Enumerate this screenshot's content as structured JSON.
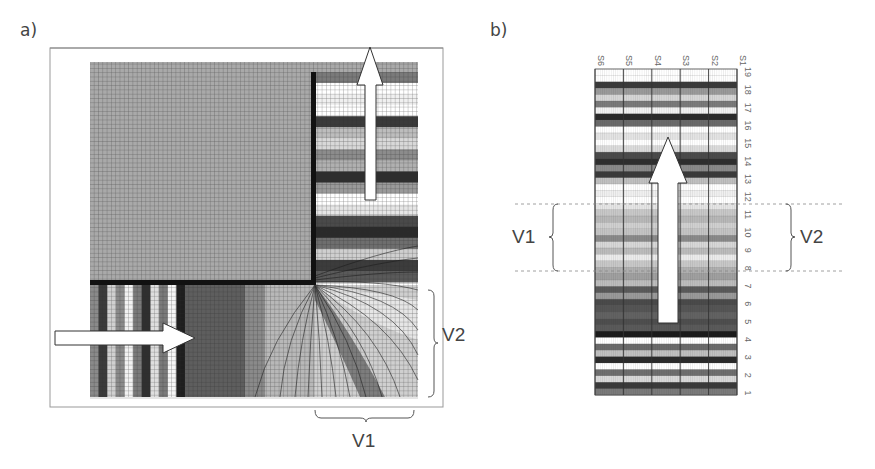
{
  "figure": {
    "panel_a": {
      "label": "a)",
      "brace_right_label": "V2",
      "brace_bottom_label": "V1",
      "arrows": [
        {
          "name": "up-arrow",
          "direction": "up"
        },
        {
          "name": "right-arrow",
          "direction": "right"
        }
      ],
      "upper_right_bands": [
        "#7a7a7a",
        "#ffffff",
        "#f0f0f0",
        "#ffffff",
        "#3a3a3a",
        "#bdbdbd",
        "#d8d8d8",
        "#8c8c8c",
        "#b0b0b0",
        "#2e2e2e",
        "#9a9a9a",
        "#ffffff",
        "#e6e6e6",
        "#4a4a4a",
        "#2a2a2a",
        "#6e6e6e",
        "#cfcfcf",
        "#3c3c3c",
        "#5a5a5a"
      ],
      "lower_left_stripes": [
        "#8a8a8a",
        "#3a3a3a",
        "#d0d0d0",
        "#8a8a8a",
        "#f2f2f2",
        "#7a7a7a",
        "#2f2f2f",
        "#dedede",
        "#7a7a7a",
        "#f5f5f5",
        "#1e1e1e"
      ]
    },
    "panel_b": {
      "label": "b)",
      "columns": [
        "S6",
        "S5",
        "S4",
        "S3",
        "S2",
        "S1"
      ],
      "rows": [
        "1",
        "2",
        "3",
        "4",
        "5",
        "6",
        "7",
        "8",
        "9",
        "10",
        "11",
        "12",
        "13",
        "14",
        "15",
        "16",
        "17",
        "18",
        "19"
      ],
      "brace_left_label": "V1",
      "brace_right_label": "V2",
      "bands": [
        "#ffffff",
        "#ffffff",
        "#3a3a3a",
        "#9a9a9a",
        "#d6d6d6",
        "#7a7a7a",
        "#f2f2f2",
        "#2a2a2a",
        "#6a6a6a",
        "#ffffff",
        "#e4e4e4",
        "#ffffff",
        "#dcdcdc",
        "#4a4a4a",
        "#2e2e2e",
        "#8a8a8a",
        "#3a3a3a",
        "#c0c0c0",
        "#ffffff",
        "#f0f0f0",
        "#ffffff",
        "#e6e6e6",
        "#c8c8c8",
        "#b8b8b8",
        "#d0d0d0",
        "#c4c4c4",
        "#8a8a8a",
        "#d8d8d8",
        "#bcbcbc",
        "#ececec",
        "#c8c8c8",
        "#b0b0b0",
        "#a0a0a0",
        "#bdbdbd",
        "#5a5a5a",
        "#9a9a9a",
        "#4a4a4a",
        "#555555",
        "#626262",
        "#4e4e4e",
        "#5a5a5a",
        "#1a1a1a",
        "#ffffff",
        "#6a6a6a",
        "#c0c0c0",
        "#2a2a2a",
        "#ffffff",
        "#6e6e6e",
        "#d8d8d8",
        "#3a3a3a",
        "#7a7a7a"
      ]
    }
  }
}
